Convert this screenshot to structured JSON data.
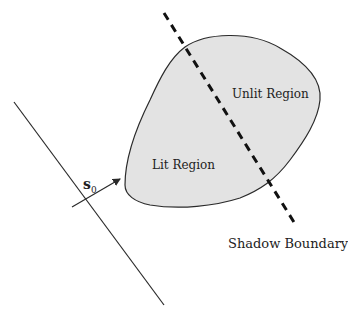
{
  "diagram": {
    "labels": {
      "unlit_region": "Unlit Region",
      "lit_region": "Lit Region",
      "shadow_boundary": "Shadow Boundary",
      "light_direction_symbol": "s",
      "light_direction_subscript": "0"
    },
    "colors": {
      "region_fill": "#e3e3e3",
      "stroke": "#2a2a2a"
    }
  }
}
